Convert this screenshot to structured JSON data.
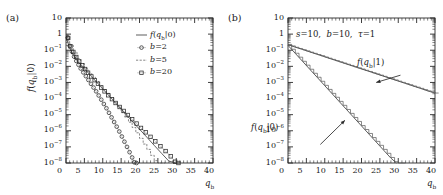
{
  "figure": {
    "width": 443,
    "height": 195,
    "background": "#ffffff",
    "ink_color": "#2a2a2a",
    "curve_color": "#555555",
    "panels": [
      {
        "id": "a",
        "label": "(a)",
        "xlabel": "q_b",
        "ylabel": "f(q_b|0)"
      },
      {
        "id": "b",
        "label": "(b)",
        "xlabel": "q_b",
        "ylabel": "",
        "annotation": "s=10,  b=10,  τ=1"
      }
    ]
  },
  "axes": {
    "x_ticks": [
      "0",
      "5",
      "10",
      "15",
      "20",
      "25",
      "30",
      "35",
      "40"
    ],
    "x_tick_values": [
      0,
      5,
      10,
      15,
      20,
      25,
      30,
      35,
      40
    ],
    "xlim": [
      0,
      40
    ],
    "y_ticks": [
      "10",
      "1",
      "10-1",
      "10-2",
      "10-3",
      "10-4",
      "10-5",
      "10-6",
      "10-7",
      "10-8"
    ],
    "y_exponents": [
      1,
      0,
      -1,
      -2,
      -3,
      -4,
      -5,
      -6,
      -7,
      -8
    ],
    "ylim_exp": [
      -8,
      1
    ],
    "y_scale": "log",
    "grid": false,
    "minor_ticks": true
  },
  "legend": {
    "position": "upper-right",
    "entries": [
      {
        "marker": "line",
        "label": "f(q_b|0)",
        "label_plain": "f(qb|0)"
      },
      {
        "marker": "circle",
        "label": "b=2",
        "label_plain": "b=2"
      },
      {
        "marker": "line-dash",
        "label": "b=5",
        "label_plain": "b=5"
      },
      {
        "marker": "square",
        "label": "b=20",
        "label_plain": "b=20"
      }
    ]
  },
  "annotations_b": [
    {
      "label": "f(q_b|1)",
      "label_plain": "f(qb|1)",
      "arrow_from": [
        30.6,
        -2.55
      ],
      "arrow_to": [
        24.0,
        -3.0
      ]
    },
    {
      "label": "f(q_b|0)",
      "label_plain": "f(qb|0)",
      "arrow_from": [
        8.8,
        -6.85
      ],
      "arrow_to": [
        15.5,
        -5.35
      ]
    }
  ],
  "chart_data": {
    "type": "line",
    "title": "",
    "xlabel": "q_b",
    "ylabel": "f(q_b|0)",
    "xlim": [
      0,
      40
    ],
    "ylim": [
      1e-08,
      10
    ],
    "yscale": "log",
    "grid": false,
    "legend_position": "upper-right",
    "panels": [
      {
        "panel": "a",
        "label": "(a)",
        "series": [
          {
            "name": "f(q_b|0) theory",
            "type": "line",
            "style": "solid",
            "x": [
              0.0,
              0.5,
              1.0,
              1.5,
              2.0,
              3.0,
              4.0,
              5.0,
              6.0,
              7.0,
              8.0,
              9.0,
              10.0,
              11.0,
              12.0,
              13.0,
              14.0,
              15.0,
              16.0,
              17.0,
              18.0,
              19.0,
              20.0,
              22.0,
              24.0,
              26.0,
              28.0,
              30.0,
              31.0
            ],
            "y": [
              0.62,
              0.3,
              0.145,
              0.082,
              0.049,
              0.023,
              0.0125,
              0.007,
              0.004,
              0.00225,
              0.00128,
              0.00072,
              0.0004,
              0.000225,
              0.000126,
              7.1e-05,
              4e-05,
              2.25e-05,
              1.26e-05,
              7.1e-06,
              4e-06,
              2.2e-06,
              1.25e-06,
              4e-07,
              1.25e-07,
              4e-08,
              1.3e-08,
              1e-08,
              1e-08
            ]
          },
          {
            "name": "b=2",
            "type": "markers",
            "marker": "circle",
            "x": [
              0.5,
              1.0,
              1.6,
              2.2,
              2.8,
              3.4,
              4.0,
              4.7,
              5.4,
              6.1,
              6.8,
              7.5,
              8.2,
              8.9,
              9.6,
              10.3,
              11.0,
              11.7,
              12.4,
              13.1,
              13.8,
              14.5,
              15.2,
              15.9,
              16.6,
              17.3,
              18.0,
              18.6,
              19.2
            ],
            "y": [
              0.6,
              0.185,
              0.082,
              0.04,
              0.0215,
              0.0125,
              0.0073,
              0.0042,
              0.00245,
              0.00142,
              0.00082,
              0.00048,
              0.00028,
              0.000155,
              8.5e-05,
              4.6e-05,
              2.5e-05,
              1.3e-05,
              6.8e-06,
              3.5e-06,
              1.8e-06,
              9e-07,
              4.4e-07,
              2.1e-07,
              1e-07,
              4.7e-08,
              2.2e-08,
              1.1e-08,
              1e-08
            ]
          },
          {
            "name": "b=5",
            "type": "step",
            "style": "dashed-step",
            "x": [
              0.0,
              1.0,
              2.0,
              3.0,
              4.0,
              5.0,
              6.0,
              7.0,
              8.0,
              9.0,
              10.0,
              11.0,
              12.0,
              13.0,
              14.0,
              15.0,
              16.0,
              17.0,
              18.0,
              19.0,
              20.0,
              21.0,
              22.0,
              23.0,
              24.0,
              25.0,
              26.0
            ],
            "y": [
              0.6,
              0.2,
              0.075,
              0.03,
              0.0145,
              0.0072,
              0.0038,
              0.0021,
              0.00115,
              0.00064,
              0.00036,
              0.00021,
              0.00011,
              5.6e-05,
              2.9e-05,
              1.45e-05,
              7e-06,
              3.4e-06,
              1.6e-06,
              7.5e-07,
              3.4e-07,
              1.5e-07,
              7e-08,
              3e-08,
              1.4e-08,
              1e-08,
              1e-08
            ]
          },
          {
            "name": "b=20",
            "type": "markers",
            "marker": "square",
            "x": [
              0.6,
              1.2,
              2.0,
              2.8,
              3.6,
              4.4,
              5.2,
              6.0,
              6.9,
              7.8,
              8.7,
              9.6,
              10.5,
              11.5,
              12.5,
              13.5,
              14.6,
              15.7,
              16.8,
              18.0,
              19.2,
              20.4,
              21.7,
              23.0,
              24.3,
              25.7,
              27.1,
              28.5,
              29.7,
              30.6
            ],
            "y": [
              0.58,
              0.175,
              0.078,
              0.038,
              0.02,
              0.0115,
              0.0068,
              0.004,
              0.00235,
              0.00138,
              0.00082,
              0.00048,
              0.00028,
              0.00016,
              9.2e-05,
              5.3e-05,
              3e-05,
              1.7e-05,
              9.5e-06,
              5.2e-06,
              2.8e-06,
              1.5e-06,
              8e-07,
              4.2e-07,
              2.2e-07,
              1.1e-07,
              5.5e-08,
              2.6e-08,
              1.2e-08,
              1e-08
            ]
          }
        ]
      },
      {
        "panel": "b",
        "label": "(b)",
        "annotation": "s=10,  b=10,  τ=1",
        "series": [
          {
            "name": "f(q_b|1)",
            "type": "line",
            "style": "solid",
            "x": [
              0.0,
              2.0,
              4.0,
              6.0,
              8.0,
              10.0,
              12.0,
              14.0,
              16.0,
              18.0,
              20.0,
              22.0,
              24.0,
              26.0,
              28.0,
              30.0,
              32.0,
              34.0,
              36.0,
              38.0,
              40.0
            ],
            "y": [
              0.22,
              0.155,
              0.11,
              0.078,
              0.055,
              0.039,
              0.0275,
              0.0195,
              0.0138,
              0.0097,
              0.0069,
              0.0049,
              0.00345,
              0.00244,
              0.00172,
              0.00122,
              0.00086,
              0.00061,
              0.00043,
              0.0003,
              0.00022
            ]
          },
          {
            "name": "f(q_b|1) histogram",
            "type": "step",
            "style": "step",
            "x": [
              0.0,
              1.0,
              2.0,
              3.0,
              4.0,
              5.0,
              6.0,
              7.0,
              8.0,
              9.0,
              10.0,
              11.0,
              12.0,
              13.0,
              14.0,
              15.0,
              16.0,
              17.0,
              18.0,
              19.0,
              20.0,
              21.0,
              22.0,
              23.0,
              24.0,
              25.0,
              26.0,
              27.0,
              28.0,
              29.0,
              30.0,
              31.0,
              32.0,
              33.0,
              34.0,
              35.0,
              36.0,
              37.0,
              38.0,
              39.0,
              40.0
            ],
            "y": [
              0.23,
              0.185,
              0.152,
              0.128,
              0.108,
              0.091,
              0.076,
              0.064,
              0.054,
              0.046,
              0.038,
              0.032,
              0.027,
              0.0227,
              0.0191,
              0.0161,
              0.0135,
              0.0114,
              0.0096,
              0.0081,
              0.0068,
              0.0057,
              0.0048,
              0.004,
              0.0034,
              0.00285,
              0.0024,
              0.00202,
              0.0017,
              0.00143,
              0.0012,
              0.00101,
              0.00085,
              0.00072,
              0.0006,
              0.00051,
              0.00043,
              0.00036,
              0.0003,
              0.00026,
              0.00022
            ]
          },
          {
            "name": "f(q_b|0)",
            "type": "line",
            "style": "solid",
            "x": [
              0.0,
              2.0,
              4.0,
              6.0,
              8.0,
              10.0,
              12.0,
              14.0,
              16.0,
              18.0,
              20.0,
              22.0,
              24.0,
              26.0,
              28.0,
              29.5
            ],
            "y": [
              0.2,
              0.063,
              0.02,
              0.0063,
              0.002,
              0.00063,
              0.0002,
              6.3e-05,
              2e-05,
              6.3e-06,
              2e-06,
              6.3e-07,
              2e-07,
              6.3e-08,
              2e-08,
              1e-08
            ]
          },
          {
            "name": "f(q_b|0) histogram",
            "type": "step",
            "style": "step",
            "x": [
              0.0,
              1.0,
              2.0,
              3.0,
              4.0,
              5.0,
              6.0,
              7.0,
              8.0,
              9.0,
              10.0,
              11.0,
              12.0,
              13.0,
              14.0,
              15.0,
              16.0,
              17.0,
              18.0,
              19.0,
              20.0,
              21.0,
              22.0,
              23.0,
              24.0,
              25.0,
              26.0,
              27.0,
              28.0,
              29.0,
              30.0,
              31.0
            ],
            "y": [
              0.21,
              0.115,
              0.065,
              0.037,
              0.0205,
              0.0118,
              0.0066,
              0.0037,
              0.0021,
              0.00118,
              0.00066,
              0.00037,
              0.00021,
              0.00012,
              6.7e-05,
              3.8e-05,
              2.1e-05,
              1.2e-05,
              6.7e-06,
              3.8e-06,
              2.1e-06,
              1.2e-06,
              6.8e-07,
              3.8e-07,
              2.2e-07,
              1.25e-07,
              7e-08,
              4e-08,
              2.2e-08,
              1.2e-08,
              1e-08,
              1e-08
            ]
          }
        ]
      }
    ]
  }
}
